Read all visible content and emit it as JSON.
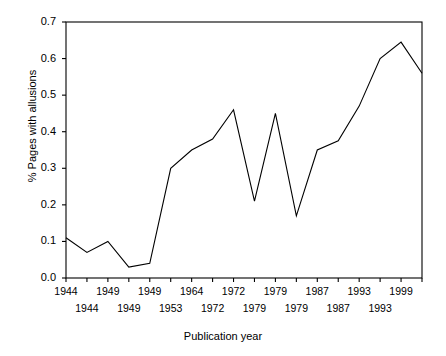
{
  "chart_data": {
    "type": "line",
    "title": "",
    "xlabel": "Publication year",
    "ylabel": "% Pages with allusions",
    "ylim": [
      0.0,
      0.7
    ],
    "yticks": [
      "0.0",
      "0.1",
      "0.2",
      "0.3",
      "0.4",
      "0.5",
      "0.6",
      "0.7"
    ],
    "ytick_values": [
      0.0,
      0.1,
      0.2,
      0.3,
      0.4,
      0.5,
      0.6,
      0.7
    ],
    "xticks_row1": [
      "1944",
      "1949",
      "1949",
      "1964",
      "1972",
      "1979",
      "1987",
      "1993",
      "1999"
    ],
    "xticks_row2": [
      "1944",
      "1949",
      "1953",
      "1972",
      "1979",
      "1979",
      "1987",
      "1993"
    ],
    "grid": false,
    "legend": "none",
    "x_index": [
      0,
      1,
      2,
      3,
      4,
      5,
      6,
      7,
      8,
      9,
      10,
      11,
      12,
      13,
      14,
      15,
      16,
      17
    ],
    "values": [
      0.11,
      0.07,
      0.1,
      0.03,
      0.04,
      0.3,
      0.35,
      0.38,
      0.46,
      0.21,
      0.45,
      0.17,
      0.35,
      0.375,
      0.47,
      0.6,
      0.645,
      0.56
    ],
    "line_color": "#000000",
    "axis_color": "#000000",
    "n_xticks": 18
  },
  "axis": {
    "y_label": "% Pages with allusions",
    "x_label": "Publication year"
  }
}
